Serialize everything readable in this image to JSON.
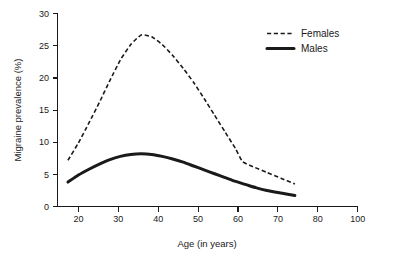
{
  "chart_data": {
    "type": "line",
    "title": "",
    "xlabel": "Age (in years)",
    "ylabel": "Migraine prevalence (%)",
    "xlim": [
      14,
      100
    ],
    "ylim": [
      0,
      30
    ],
    "xticks": [
      20,
      30,
      40,
      50,
      60,
      70,
      80,
      100
    ],
    "yticks": [
      0,
      5,
      10,
      15,
      20,
      25,
      30
    ],
    "grid": false,
    "legend_position": "top-right",
    "series": [
      {
        "name": "Females",
        "style": "dashed",
        "color": "#1a1a1a",
        "x": [
          17,
          20,
          23,
          26,
          29,
          32,
          35,
          38,
          41,
          44,
          47,
          50,
          53,
          56,
          59,
          62,
          65,
          67,
          70,
          74,
          78,
          82
        ],
        "values": [
          7.2,
          9.9,
          13.0,
          16.2,
          19.6,
          22.8,
          25.2,
          26.7,
          26.4,
          25.2,
          23.5,
          21.5,
          19.3,
          16.8,
          14.2,
          11.6,
          9.0,
          7.0,
          6.2,
          5.3,
          4.4,
          3.5
        ]
      },
      {
        "name": "Males",
        "style": "solid",
        "color": "#1a1a1a",
        "x": [
          17,
          20,
          23,
          26,
          29,
          32,
          35,
          38,
          41,
          44,
          47,
          50,
          53,
          56,
          59,
          62,
          65,
          68,
          71,
          74,
          78,
          82
        ],
        "values": [
          3.8,
          4.9,
          5.8,
          6.6,
          7.3,
          7.8,
          8.1,
          8.2,
          8.1,
          7.8,
          7.4,
          6.9,
          6.3,
          5.7,
          5.1,
          4.5,
          3.9,
          3.4,
          2.9,
          2.5,
          2.1,
          1.7
        ]
      }
    ]
  },
  "axes": {
    "x_title": "Age (in years)",
    "y_title": "Migraine prevalence (%)",
    "x_tick_labels": [
      "20",
      "30",
      "40",
      "50",
      "60",
      "70",
      "80",
      "100"
    ],
    "y_tick_labels": [
      "0",
      "5",
      "10",
      "15",
      "20",
      "25",
      "30"
    ]
  },
  "legend": {
    "entries": [
      {
        "label": "Females",
        "style": "dashed"
      },
      {
        "label": "Males",
        "style": "solid"
      }
    ]
  },
  "colors": {
    "ink": "#1a1a1a",
    "background": "#ffffff"
  }
}
